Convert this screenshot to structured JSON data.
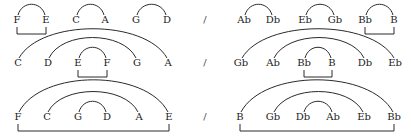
{
  "diagram": {
    "type": "pitch-pairing diagram",
    "separator": "/",
    "rows": [
      {
        "left": {
          "notes": [
            "F",
            "E",
            "C",
            "A",
            "G",
            "D"
          ],
          "arcs": [
            [
              0,
              1
            ],
            [
              2,
              3
            ],
            [
              4,
              5
            ]
          ],
          "brackets": [
            [
              0,
              1
            ]
          ]
        },
        "right": {
          "notes": [
            "Ab",
            "Db",
            "Eb",
            "Gb",
            "Bb",
            "B"
          ],
          "arcs": [
            [
              0,
              1
            ],
            [
              2,
              3
            ],
            [
              4,
              5
            ]
          ],
          "brackets": [
            [
              4,
              5
            ]
          ]
        }
      },
      {
        "left": {
          "notes": [
            "C",
            "D",
            "E",
            "F",
            "G",
            "A"
          ],
          "arcs": [
            [
              0,
              5
            ],
            [
              1,
              4
            ],
            [
              2,
              3
            ]
          ],
          "brackets": [
            [
              2,
              3
            ]
          ]
        },
        "right": {
          "notes": [
            "Gb",
            "Ab",
            "Bb",
            "B",
            "Db",
            "Eb"
          ],
          "arcs": [
            [
              0,
              5
            ],
            [
              1,
              4
            ],
            [
              2,
              3
            ]
          ],
          "brackets": [
            [
              2,
              3
            ]
          ]
        }
      },
      {
        "left": {
          "notes": [
            "F",
            "C",
            "G",
            "D",
            "A",
            "E"
          ],
          "arcs": [
            [
              0,
              5
            ],
            [
              1,
              4
            ],
            [
              2,
              3
            ]
          ],
          "brackets": [
            [
              0,
              5
            ]
          ]
        },
        "right": {
          "notes": [
            "B",
            "Gb",
            "Db",
            "Ab",
            "Eb",
            "Bb"
          ],
          "arcs": [
            [
              0,
              5
            ],
            [
              1,
              4
            ],
            [
              2,
              3
            ]
          ],
          "brackets": [
            [
              0,
              5
            ]
          ]
        }
      }
    ]
  }
}
